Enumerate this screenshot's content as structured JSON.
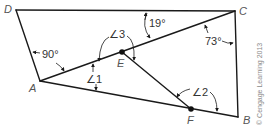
{
  "figure": {
    "vertices": {
      "D": "D",
      "C": "C",
      "A": "A",
      "B": "B",
      "E": "E",
      "F": "F"
    },
    "angles": {
      "right_angle_A": "90°",
      "angle_at_C_top": "19°",
      "angle_at_C_side": "73°",
      "angle_1": "∠1",
      "angle_2": "∠2",
      "angle_3": "∠3"
    },
    "credit": "© Cengage Learning 2013"
  }
}
